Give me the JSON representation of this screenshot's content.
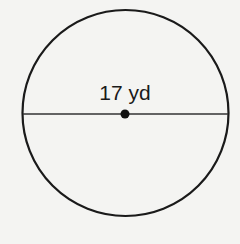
{
  "diagram": {
    "type": "circle",
    "measurement_label": "17 yd",
    "measurement": "diameter",
    "value": 17,
    "unit": "yd",
    "colors": {
      "background": "#f4f4f2",
      "stroke": "#1a1a1a"
    }
  }
}
